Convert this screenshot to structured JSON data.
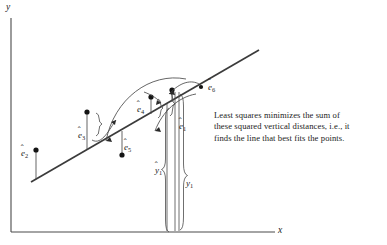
{
  "figure": {
    "title_present": false,
    "axes": {
      "y_label": "y",
      "x_label": "x",
      "x_axis": {
        "x1": 11,
        "y1": 232,
        "x2": 275,
        "y2": 232
      },
      "y_axis": {
        "x1": 11,
        "y1": 18,
        "x2": 11,
        "y2": 232
      }
    },
    "regression_line": {
      "x1": 31,
      "y1": 182,
      "x2": 259,
      "y2": 50
    },
    "caption": {
      "lines": [
        "Least squares minimizes the sum of",
        "these squared vertical distances, i.e., it",
        "finds the line that best fits the points."
      ]
    },
    "residual_labels": [
      {
        "name": "e1",
        "text": "e",
        "sub": "1",
        "hat": true,
        "x": 179,
        "y": 121
      },
      {
        "name": "e2",
        "text": "e",
        "sub": "2",
        "hat": true,
        "x": 21,
        "y": 148
      },
      {
        "name": "e3",
        "text": "e",
        "sub": "3",
        "hat": true,
        "x": 78,
        "y": 130
      },
      {
        "name": "e4",
        "text": "e",
        "sub": "4",
        "hat": true,
        "x": 137,
        "y": 104
      },
      {
        "name": "e5",
        "text": "e",
        "sub": "5",
        "hat": true,
        "x": 124,
        "y": 142
      },
      {
        "name": "e6",
        "text": "e",
        "sub": "6",
        "hat": true,
        "x": 208,
        "y": 90
      }
    ],
    "measure_labels": [
      {
        "name": "y-hat-1",
        "text": "y",
        "sub": "1",
        "hat": true,
        "x": 161,
        "y": 168
      },
      {
        "name": "y-1",
        "text": "y",
        "sub": "1",
        "hat": false,
        "x": 182,
        "y": 181
      }
    ],
    "data_points": [
      {
        "name": "point-2",
        "x": 36,
        "y": 150
      },
      {
        "name": "point-3",
        "x": 87,
        "y": 112
      },
      {
        "name": "point-5",
        "x": 122,
        "y": 155
      },
      {
        "name": "point-4",
        "x": 151,
        "y": 97
      },
      {
        "name": "point-4b",
        "x": 172,
        "y": 90
      },
      {
        "name": "point-6",
        "x": 201,
        "y": 87
      }
    ],
    "colors": {
      "ink": "#1b1b1b",
      "line": "#3a3a3a",
      "thin": "#4a4a4a",
      "background": "#ffffff"
    }
  }
}
